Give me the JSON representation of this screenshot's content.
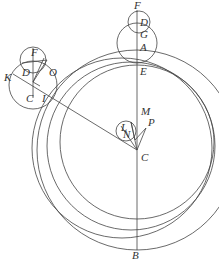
{
  "diagram": {
    "type": "geometric-construction",
    "stroke_color": "#444444",
    "background": "#ffffff",
    "labels": {
      "F_top": "F",
      "D_top": "D",
      "G": "G",
      "A": "A",
      "E": "E",
      "M": "M",
      "P": "P",
      "L": "L",
      "N": "N",
      "C_center": "C",
      "B": "B",
      "F_left": "F",
      "K": "K",
      "D_left": "D",
      "O": "O",
      "C_left": "C",
      "I": "I"
    }
  }
}
